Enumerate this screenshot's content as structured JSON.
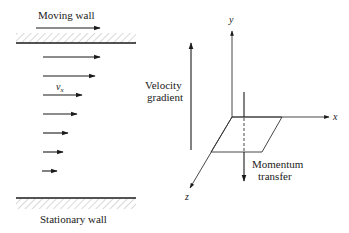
{
  "diagram": {
    "left_panel": {
      "top_wall_label": "Moving wall",
      "bottom_wall_label": "Stationary wall",
      "velocity_label": "v",
      "velocity_subscript": "x",
      "velocity_profile_arrows": [
        {
          "y": 57,
          "x1": 43,
          "x2": 100
        },
        {
          "y": 76,
          "x1": 43,
          "x2": 95
        },
        {
          "y": 95,
          "x1": 43,
          "x2": 82
        },
        {
          "y": 114,
          "x1": 43,
          "x2": 77
        },
        {
          "y": 133,
          "x1": 43,
          "x2": 68
        },
        {
          "y": 152,
          "x1": 43,
          "x2": 63
        },
        {
          "y": 171,
          "x1": 42,
          "x2": 57
        }
      ]
    },
    "middle": {
      "velocity_gradient_label_line1": "Velocity",
      "velocity_gradient_label_line2": "gradient"
    },
    "right_panel": {
      "axis_y_label": "y",
      "axis_x_label": "x",
      "axis_z_label": "z",
      "momentum_label_line1": "Momentum",
      "momentum_label_line2": "transfer"
    },
    "colors": {
      "line": "#1a1a1a",
      "hatch": "#9a9a9a",
      "background": "#ffffff"
    }
  }
}
